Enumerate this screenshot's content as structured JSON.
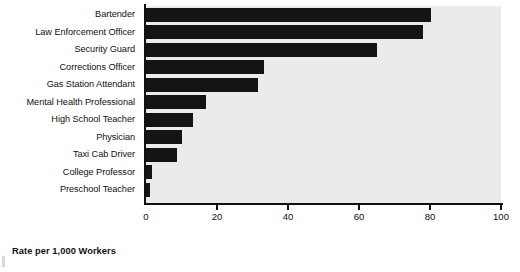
{
  "chart_data": {
    "type": "bar",
    "orientation": "horizontal",
    "title": "",
    "xlabel": "Rate per 1,000 Workers",
    "ylabel": "",
    "xlim": [
      0,
      100
    ],
    "xticks": [
      0,
      20,
      40,
      60,
      80,
      100
    ],
    "xtick_labels": [
      "0",
      "20",
      "40",
      "60",
      "80",
      "100"
    ],
    "grid": false,
    "legend": false,
    "bar_color": "#141414",
    "plot_background": "#ebebeb",
    "figure_background": "#ffffff",
    "categories": [
      "Bartender",
      "Law Enforcement Officer",
      "Security Guard",
      "Corrections Officer",
      "Gas Station Attendant",
      "Mental Health Professional",
      "High School Teacher",
      "Physician",
      "Taxi Cab Driver",
      "College Professor",
      "Preschool Teacher"
    ],
    "values": [
      80.4,
      78.0,
      65.0,
      33.2,
      31.5,
      16.8,
      13.2,
      10.2,
      8.6,
      1.8,
      1.0
    ]
  },
  "axis_title": "Rate per 1,000 Workers"
}
